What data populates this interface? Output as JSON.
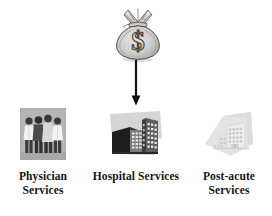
{
  "diagram": {
    "source": {
      "icon": "money-bag-icon",
      "symbol": "$",
      "label": ""
    },
    "flow": {
      "icon": "down-arrow-icon",
      "direction": "down"
    },
    "services": [
      {
        "id": "physician",
        "icon": "physician-group-photo",
        "label_lines": [
          "Physician",
          "Services"
        ],
        "label": "Physician Services"
      },
      {
        "id": "hospital",
        "icon": "hospital-building-photo",
        "label_lines": [
          "Hospital Services"
        ],
        "label": "Hospital Services"
      },
      {
        "id": "post-acute",
        "icon": "post-acute-facility-photo",
        "label_lines": [
          "Post-acute",
          "Services"
        ],
        "label": "Post-acute Services"
      }
    ]
  },
  "colors": {
    "background": "#ffffff",
    "text": "#141414",
    "arrow": "#111111",
    "photo_gray": "#b9b9b9",
    "light_gray": "#d9d9d9"
  }
}
